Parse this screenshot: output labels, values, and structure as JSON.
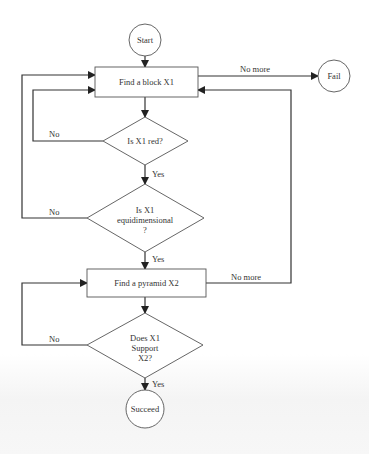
{
  "diagram": {
    "type": "flowchart",
    "nodes": {
      "start": {
        "label": "Start",
        "shape": "circle"
      },
      "find_block": {
        "label": "Find a block X1",
        "shape": "rectangle"
      },
      "fail": {
        "label": "Fail",
        "shape": "circle"
      },
      "is_red": {
        "label": "Is X1 red?",
        "shape": "diamond"
      },
      "is_equi": {
        "line1": "Is X1",
        "line2": "equidimensional",
        "line3": "?",
        "shape": "diamond"
      },
      "find_pyramid": {
        "label": "Find a pyramid X2",
        "shape": "rectangle"
      },
      "supports": {
        "line1": "Does X1",
        "line2": "Support",
        "line3": "X2?",
        "shape": "diamond"
      },
      "succeed": {
        "label": "Succeed",
        "shape": "circle"
      }
    },
    "edges": {
      "block_no_more": "No more",
      "red_no": "No",
      "red_yes": "Yes",
      "equi_no": "No",
      "equi_yes": "Yes",
      "pyramid_no_more": "No more",
      "support_no": "No",
      "support_yes": "Yes"
    }
  }
}
